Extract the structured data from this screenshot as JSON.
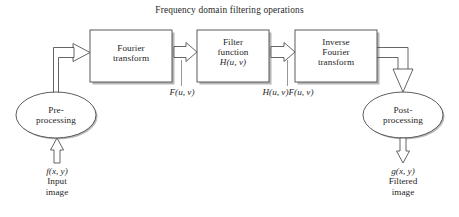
{
  "diagram": {
    "title": "Frequency domain filtering operations",
    "type": "block-flow-diagram",
    "background_color": "#ffffff",
    "stroke_color": "#4a4a4a",
    "text_color": "#1f1f1f",
    "nodes": {
      "preprocessing": {
        "shape": "ellipse",
        "line1": "Pre-",
        "line2": "processing"
      },
      "fourier_transform": {
        "shape": "rectangle",
        "line1": "Fourier",
        "line2": "transform"
      },
      "filter_function": {
        "shape": "rectangle",
        "line1": "Filter",
        "line2": "function",
        "line3_italic_H": "H",
        "line3_rest": "(u, v)",
        "line3": "H(u, v)"
      },
      "inverse_fourier_transform": {
        "shape": "rectangle",
        "line1": "Inverse",
        "line2": "Fourier",
        "line3": "transform"
      },
      "postprocessing": {
        "shape": "ellipse",
        "line1": "Post-",
        "line2": "processing"
      }
    },
    "signal_labels": {
      "after_fourier": "F(u, v)",
      "after_filter": "H(u, v)F(u, v)"
    },
    "input_label": {
      "symbol": "f(x, y)",
      "line1": "Input",
      "line2": "image"
    },
    "output_label": {
      "symbol": "g(x, y)",
      "line1": "Filtered",
      "line2": "image"
    },
    "arrows": [
      {
        "name": "input-to-preprocessing",
        "direction": "up"
      },
      {
        "name": "preprocessing-to-fourier",
        "direction": "right"
      },
      {
        "name": "fourier-to-filter",
        "direction": "right"
      },
      {
        "name": "filter-to-inverse-fourier",
        "direction": "right"
      },
      {
        "name": "inverse-fourier-to-postprocessing",
        "direction": "down"
      },
      {
        "name": "postprocessing-to-output",
        "direction": "down"
      }
    ]
  }
}
